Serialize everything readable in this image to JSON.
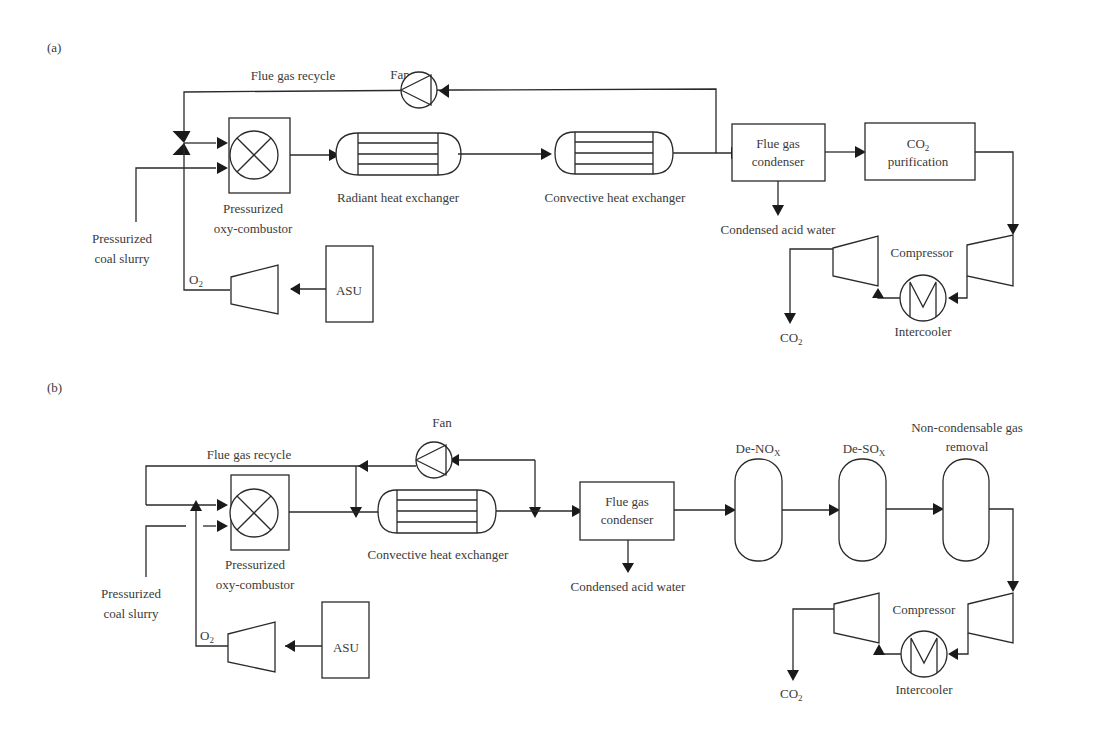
{
  "panel_a": {
    "label": "(a)",
    "fan": "Fan",
    "flue_gas_recycle": "Flue gas recycle",
    "combustor_l1": "Pressurized",
    "combustor_l2": "oxy-combustor",
    "radiant_hx": "Radiant heat exchanger",
    "convective_hx": "Convective heat exchanger",
    "condenser_l1": "Flue gas",
    "condenser_l2": "condenser",
    "co2_purif_l1": "CO",
    "co2_purif_sub": "2",
    "co2_purif_l2": "purification",
    "acid_water": "Condensed acid water",
    "compressor": "Compressor",
    "intercooler": "Intercooler",
    "co2_out": "CO",
    "co2_out_sub": "2",
    "coal_l1": "Pressurized",
    "coal_l2": "coal slurry",
    "o2": "O",
    "o2_sub": "2",
    "asu": "ASU"
  },
  "panel_b": {
    "label": "(b)",
    "fan": "Fan",
    "flue_gas_recycle": "Flue gas recycle",
    "combustor_l1": "Pressurized",
    "combustor_l2": "oxy-combustor",
    "convective_hx": "Convective heat exchanger",
    "condenser_l1": "Flue gas",
    "condenser_l2": "condenser",
    "acid_water": "Condensed acid water",
    "denox": "De-NO",
    "denox_sub": "X",
    "desox": "De-SO",
    "desox_sub": "X",
    "ncg_l1": "Non-condensable gas",
    "ncg_l2": "removal",
    "compressor": "Compressor",
    "intercooler": "Intercooler",
    "co2_out": "CO",
    "co2_out_sub": "2",
    "coal_l1": "Pressurized",
    "coal_l2": "coal slurry",
    "o2": "O",
    "o2_sub": "2",
    "asu": "ASU"
  }
}
